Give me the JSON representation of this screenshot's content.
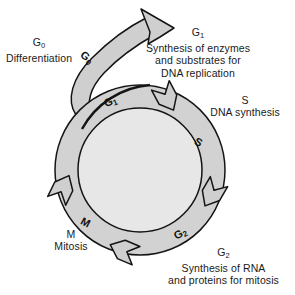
{
  "diagram": {
    "title_present": false,
    "colors": {
      "ring_fill": "#d2d2d2",
      "inner_fill": "#e7e7e7",
      "arrow_fill": "#cfcfcf",
      "outline": "#141414",
      "background": "#ffffff",
      "text": "#1a1a1a"
    },
    "phases": [
      {
        "key": "g0",
        "ring_label": "G",
        "ring_sub": "0",
        "title": "G",
        "title_sub": "0",
        "lines": [
          "Differentiation"
        ]
      },
      {
        "key": "g1",
        "ring_label": "G",
        "ring_sub": "1",
        "title": "G",
        "title_sub": "1",
        "lines": [
          "Synthesis of enzymes",
          "and substrates for",
          "DNA replication"
        ]
      },
      {
        "key": "s",
        "ring_label": "S",
        "ring_sub": "",
        "title": "S",
        "title_sub": "",
        "lines": [
          "DNA synthesis"
        ]
      },
      {
        "key": "g2",
        "ring_label": "G",
        "ring_sub": "2",
        "title": "G",
        "title_sub": "2",
        "lines": [
          "Synthesis of RNA",
          "and proteins for mitosis"
        ]
      },
      {
        "key": "m",
        "ring_label": "M",
        "ring_sub": "",
        "title": "M",
        "title_sub": "",
        "lines": [
          "Mitosis"
        ]
      }
    ],
    "labels": {
      "g0_title": "G",
      "g0_title_sub": "0",
      "g0_line1": "Differentiation",
      "g0_ring": "G",
      "g0_ring_sub": "0",
      "g1_title": "G",
      "g1_title_sub": "1",
      "g1_line1": "Synthesis of enzymes",
      "g1_line2": "and substrates for",
      "g1_line3": "DNA replication",
      "g1_ring": "G",
      "g1_ring_sub": "1",
      "s_title": "S",
      "s_line1": "DNA synthesis",
      "s_ring": "S",
      "g2_title": "G",
      "g2_title_sub": "2",
      "g2_line1": "Synthesis of RNA",
      "g2_line2": "and proteins for mitosis",
      "g2_ring": "G",
      "g2_ring_sub": "2",
      "m_title": "M",
      "m_line1": "Mitosis",
      "m_ring": "M"
    }
  }
}
